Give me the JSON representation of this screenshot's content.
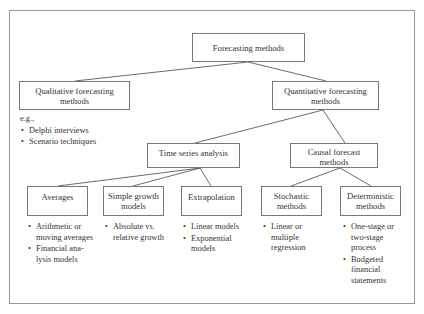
{
  "diagram": {
    "root": {
      "label": "Forecasting methods"
    },
    "qualitative": {
      "label": "Qualitative forecasting methods",
      "line1": "Qualitative forecasting",
      "line2": "methods",
      "notes_intro": "e.g.,",
      "notes": [
        "Delphi interviews",
        "Scenario techniques"
      ]
    },
    "quantitative": {
      "label": "Quantitative forecasting methods",
      "line1": "Quantitative forecasting",
      "line2": "methods"
    },
    "time_series": {
      "label": "Time series analysis"
    },
    "causal": {
      "line1": "Causal forecast",
      "line2": "methods"
    },
    "averages": {
      "label": "Averages",
      "notes": [
        {
          "l1": "Arithmetic or",
          "l2": "moving averages",
          "l3": ""
        },
        {
          "l1": "Financial ana-",
          "l2": "lysis models",
          "l3": ""
        }
      ]
    },
    "simple_growth": {
      "line1": "Simple growth",
      "line2": "models",
      "notes": [
        {
          "l1": "Absolute vs.",
          "l2": "relative growth",
          "l3": ""
        }
      ]
    },
    "extrapolation": {
      "label": "Extrapolation",
      "notes": [
        {
          "l1": "Linear models",
          "l2": "",
          "l3": ""
        },
        {
          "l1": "Exponential",
          "l2": "models",
          "l3": ""
        }
      ]
    },
    "stochastic": {
      "line1": "Stochastic",
      "line2": "methods",
      "notes": [
        {
          "l1": "Linear or",
          "l2": "multiple",
          "l3": "regression"
        }
      ]
    },
    "deterministic": {
      "line1": "Deterministic",
      "line2": "methods",
      "notes": [
        {
          "l1": "One-stage or",
          "l2": "two-stage",
          "l3": "process"
        },
        {
          "l1": "Budgeted",
          "l2": "financial",
          "l3": "statements"
        }
      ]
    },
    "edges": [
      [
        "root",
        "qualitative"
      ],
      [
        "root",
        "quantitative"
      ],
      [
        "quantitative",
        "time_series"
      ],
      [
        "quantitative",
        "causal"
      ],
      [
        "time_series",
        "averages"
      ],
      [
        "time_series",
        "simple_growth"
      ],
      [
        "time_series",
        "extrapolation"
      ],
      [
        "causal",
        "stochastic"
      ],
      [
        "causal",
        "deterministic"
      ]
    ]
  },
  "colors": {
    "box_border": "#777777",
    "frame_border": "#999999",
    "text": "#333333",
    "line": "#444444"
  }
}
